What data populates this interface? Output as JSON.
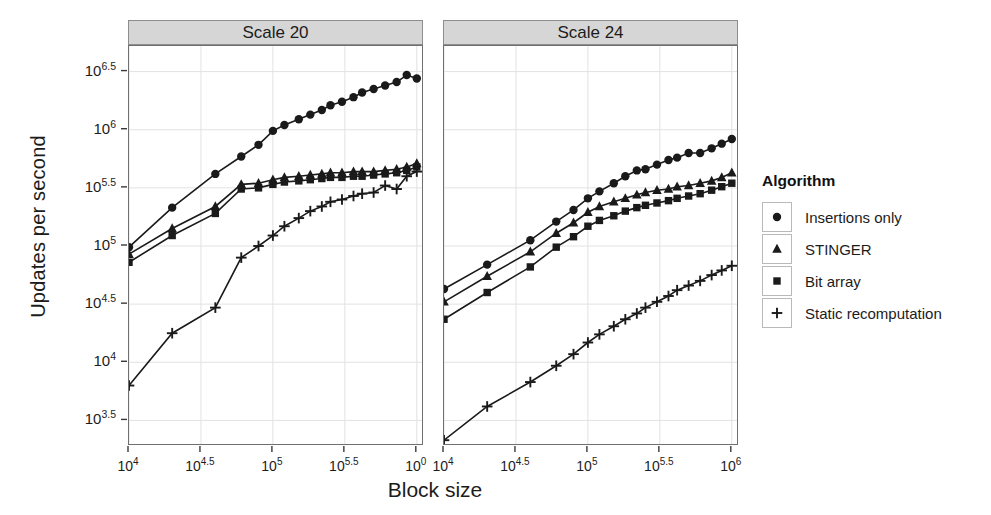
{
  "chart_data": {
    "type": "line",
    "title": "",
    "xlabel": "Block size",
    "ylabel": "Updates per second",
    "xscale": "log10",
    "yscale": "log10",
    "xlim": [
      4.0,
      6.05
    ],
    "ylim": [
      3.28,
      6.72
    ],
    "grid": true,
    "legend_position": "right",
    "legend_title": "Algorithm",
    "facet_labels": [
      "Scale 20",
      "Scale 24"
    ],
    "x_tick_labels": [
      "10^4",
      "10^4.5",
      "10^5",
      "10^5.5",
      "10^6"
    ],
    "x_tick_labels_left": [
      "10^4",
      "10^4.5",
      "10^5",
      "10^5.5",
      "10^0"
    ],
    "x_tick_values": [
      4.0,
      4.5,
      5.0,
      5.5,
      6.0
    ],
    "y_tick_labels": [
      "10^6.5",
      "10^6",
      "10^5.5",
      "10^5",
      "10^4.5",
      "10^4",
      "10^3.5"
    ],
    "y_tick_values": [
      6.5,
      6.0,
      5.5,
      5.0,
      4.5,
      4.0,
      3.5
    ],
    "series_names": [
      "Insertions only",
      "STINGER",
      "Bit array",
      "Static recomputation"
    ],
    "series_markers": [
      "circle",
      "triangle",
      "square",
      "plus"
    ],
    "panels": [
      {
        "label": "Scale 20",
        "series": [
          {
            "name": "Insertions only",
            "marker": "circle",
            "x": [
              4.0,
              4.3,
              4.6,
              4.78,
              4.9,
              5.0,
              5.08,
              5.18,
              5.26,
              5.34,
              5.4,
              5.48,
              5.56,
              5.62,
              5.7,
              5.78,
              5.86,
              5.93,
              6.0
            ],
            "y": [
              4.99,
              5.33,
              5.62,
              5.77,
              5.87,
              5.99,
              6.04,
              6.09,
              6.13,
              6.17,
              6.21,
              6.24,
              6.28,
              6.32,
              6.35,
              6.38,
              6.41,
              6.47,
              6.44
            ]
          },
          {
            "name": "STINGER",
            "marker": "triangle",
            "x": [
              4.0,
              4.3,
              4.6,
              4.78,
              4.9,
              5.0,
              5.08,
              5.18,
              5.26,
              5.34,
              5.4,
              5.48,
              5.56,
              5.62,
              5.7,
              5.78,
              5.86,
              5.93,
              6.0
            ],
            "y": [
              4.93,
              5.15,
              5.34,
              5.53,
              5.54,
              5.57,
              5.59,
              5.6,
              5.61,
              5.62,
              5.63,
              5.63,
              5.64,
              5.64,
              5.64,
              5.65,
              5.66,
              5.68,
              5.71
            ]
          },
          {
            "name": "Bit array",
            "marker": "square",
            "x": [
              4.0,
              4.3,
              4.6,
              4.78,
              4.9,
              5.0,
              5.08,
              5.18,
              5.26,
              5.34,
              5.4,
              5.48,
              5.56,
              5.62,
              5.7,
              5.78,
              5.86,
              5.93,
              6.0
            ],
            "y": [
              4.86,
              5.09,
              5.28,
              5.49,
              5.5,
              5.53,
              5.55,
              5.56,
              5.57,
              5.58,
              5.59,
              5.59,
              5.6,
              5.6,
              5.61,
              5.62,
              5.63,
              5.65,
              5.68
            ]
          },
          {
            "name": "Static recomputation",
            "marker": "plus",
            "x": [
              4.0,
              4.3,
              4.6,
              4.78,
              4.9,
              5.0,
              5.08,
              5.18,
              5.26,
              5.34,
              5.4,
              5.48,
              5.56,
              5.62,
              5.7,
              5.78,
              5.86,
              5.93,
              6.0
            ],
            "y": [
              3.8,
              4.25,
              4.47,
              4.9,
              5.0,
              5.09,
              5.17,
              5.24,
              5.3,
              5.34,
              5.38,
              5.4,
              5.43,
              5.45,
              5.46,
              5.52,
              5.49,
              5.6,
              5.64
            ]
          }
        ]
      },
      {
        "label": "Scale 24",
        "series": [
          {
            "name": "Insertions only",
            "marker": "circle",
            "x": [
              4.0,
              4.3,
              4.6,
              4.78,
              4.9,
              5.0,
              5.08,
              5.18,
              5.26,
              5.34,
              5.4,
              5.48,
              5.56,
              5.62,
              5.7,
              5.78,
              5.86,
              5.93,
              6.0
            ],
            "y": [
              4.63,
              4.84,
              5.05,
              5.21,
              5.31,
              5.41,
              5.47,
              5.54,
              5.6,
              5.65,
              5.66,
              5.7,
              5.74,
              5.76,
              5.8,
              5.8,
              5.84,
              5.88,
              5.92
            ]
          },
          {
            "name": "STINGER",
            "marker": "triangle",
            "x": [
              4.0,
              4.3,
              4.6,
              4.78,
              4.9,
              5.0,
              5.08,
              5.18,
              5.26,
              5.34,
              5.4,
              5.48,
              5.56,
              5.62,
              5.7,
              5.78,
              5.86,
              5.93,
              6.0
            ],
            "y": [
              4.52,
              4.74,
              4.95,
              5.11,
              5.2,
              5.29,
              5.34,
              5.38,
              5.41,
              5.44,
              5.46,
              5.48,
              5.49,
              5.51,
              5.52,
              5.54,
              5.56,
              5.59,
              5.63
            ]
          },
          {
            "name": "Bit array",
            "marker": "square",
            "x": [
              4.0,
              4.3,
              4.6,
              4.78,
              4.9,
              5.0,
              5.08,
              5.18,
              5.26,
              5.34,
              5.4,
              5.48,
              5.56,
              5.62,
              5.7,
              5.78,
              5.86,
              5.93,
              6.0
            ],
            "y": [
              4.37,
              4.6,
              4.82,
              4.99,
              5.08,
              5.17,
              5.22,
              5.26,
              5.3,
              5.33,
              5.35,
              5.37,
              5.39,
              5.41,
              5.43,
              5.45,
              5.48,
              5.51,
              5.54
            ]
          },
          {
            "name": "Static recomputation",
            "marker": "plus",
            "x": [
              4.0,
              4.3,
              4.6,
              4.78,
              4.9,
              5.0,
              5.08,
              5.18,
              5.26,
              5.34,
              5.4,
              5.48,
              5.56,
              5.62,
              5.7,
              5.78,
              5.86,
              5.93,
              6.0
            ],
            "y": [
              3.33,
              3.62,
              3.83,
              3.97,
              4.07,
              4.17,
              4.24,
              4.31,
              4.37,
              4.42,
              4.47,
              4.52,
              4.57,
              4.62,
              4.66,
              4.7,
              4.75,
              4.79,
              4.83
            ]
          }
        ]
      }
    ],
    "legend_entries": [
      {
        "label": "Insertions only",
        "marker": "circle"
      },
      {
        "label": "STINGER",
        "marker": "triangle"
      },
      {
        "label": "Bit array",
        "marker": "square"
      },
      {
        "label": "Static recomputation",
        "marker": "plus"
      }
    ],
    "colors": {
      "series": "#1a1a1a",
      "panel_background": "#ffffff",
      "grid": "#e2e2e2",
      "strip_background": "#d6d6d6",
      "strip_border": "#8d8d8d",
      "panel_border": "#707070",
      "figure_background": "#ffffff"
    }
  }
}
